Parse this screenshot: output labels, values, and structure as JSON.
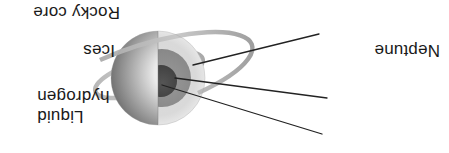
{
  "figure": {
    "orientation": "upside-down",
    "background_color": "#ffffff",
    "width": 449,
    "height": 153
  },
  "planet": {
    "name": "Neptune",
    "center": {
      "x": 291,
      "y": 75
    },
    "radius": 47,
    "has_ring": true,
    "ring_color": "#b9b9b9"
  },
  "labels": {
    "planet_name": "Neptune",
    "rocky_core": "Rocky core",
    "ices": "Ices",
    "liquid_hydrogen_line1": "Liquid",
    "liquid_hydrogen_line2": "hydrogen"
  },
  "layers": [
    {
      "name": "liquid-hydrogen",
      "label": "Liquid hydrogen",
      "color": "#d8d8d8",
      "radius": 47
    },
    {
      "name": "ices",
      "label": "Ices",
      "color": "#8e8e8e",
      "radius": 29
    },
    {
      "name": "rocky-core",
      "label": "Rocky core",
      "color": "#4a4a4a",
      "radius": 16
    }
  ],
  "leader_lines": [
    {
      "name": "leader-rocky-core",
      "from": {
        "x": 127,
        "y": 19
      },
      "to": {
        "x": 287,
        "y": 68
      }
    },
    {
      "name": "leader-ices",
      "from": {
        "x": 122,
        "y": 55
      },
      "to": {
        "x": 272,
        "y": 74
      }
    },
    {
      "name": "leader-liquid-hydrogen",
      "from": {
        "x": 130,
        "y": 119
      },
      "to": {
        "x": 256,
        "y": 87
      }
    }
  ],
  "colors": {
    "text": "#1a1a1a",
    "line": "#222222",
    "outer_layer": "#d8d8d8",
    "mid_layer": "#8e8e8e",
    "core": "#4a4a4a",
    "sphere_light": "#f2f2f2",
    "sphere_dark": "#5a5a5a"
  }
}
